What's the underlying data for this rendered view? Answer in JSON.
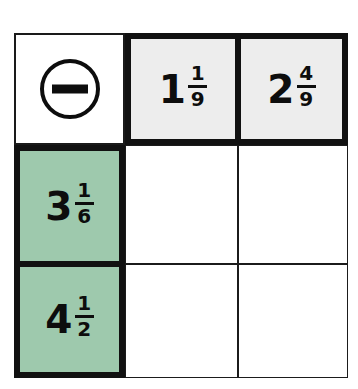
{
  "worksheet": {
    "type": "subtraction-grid",
    "operator_symbol": "minus-in-circle",
    "operator_label": "−",
    "column_headers": [
      {
        "whole": "1",
        "numerator": "1",
        "denominator": "9",
        "text": "1 1/9"
      },
      {
        "whole": "2",
        "numerator": "4",
        "denominator": "9",
        "text": "2 4/9"
      }
    ],
    "row_headers": [
      {
        "whole": "3",
        "numerator": "1",
        "denominator": "6",
        "text": "3 1/6"
      },
      {
        "whole": "4",
        "numerator": "1",
        "denominator": "2",
        "text": "4 1/2"
      }
    ],
    "body_cells": [
      {
        "value": ""
      },
      {
        "value": ""
      },
      {
        "value": ""
      },
      {
        "value": ""
      }
    ],
    "colors": {
      "row_header_fill": "#9ec9ad",
      "column_header_fill": "#ededed",
      "border": "#111111",
      "text": "#0d0d0d",
      "body_fill": "#ffffff"
    }
  }
}
